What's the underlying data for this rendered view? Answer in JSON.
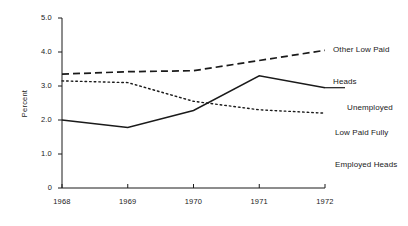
{
  "chart_data": {
    "type": "line",
    "title": "",
    "xlabel": "",
    "ylabel": "Percent",
    "categories": [
      "1968",
      "1969",
      "1970",
      "1971",
      "1972"
    ],
    "x": [
      1968,
      1969,
      1970,
      1971,
      1972
    ],
    "xlim": [
      1968,
      1972
    ],
    "ylim": [
      0,
      5.0
    ],
    "yticks": [
      "0",
      "1.0",
      "2.0",
      "3.0",
      "4.0",
      "5.0"
    ],
    "ytick_values": [
      0,
      1.0,
      2.0,
      3.0,
      4.0,
      5.0
    ],
    "xticks": [
      "1968",
      "1969",
      "1970",
      "1971",
      "1972"
    ],
    "grid": false,
    "legend_position": "inline-right-of-line-ends",
    "series": [
      {
        "name": "Other Low Paid Heads",
        "label_lines": [
          "Other Low Paid",
          "Heads"
        ],
        "style": "dashed",
        "color": "#1a1a1a",
        "values": [
          3.35,
          3.42,
          3.45,
          3.75,
          4.05
        ]
      },
      {
        "name": "Unemployed",
        "label_lines": [
          "Unemployed"
        ],
        "style": "solid",
        "color": "#1a1a1a",
        "values": [
          2.0,
          1.78,
          2.28,
          3.3,
          2.95
        ]
      },
      {
        "name": "Low Paid Fully Employed Heads",
        "label_lines": [
          "Low Paid Fully",
          "Employed Heads"
        ],
        "style": "dotted",
        "color": "#1a1a1a",
        "values": [
          3.15,
          3.1,
          2.55,
          2.3,
          2.2
        ]
      }
    ]
  },
  "axis": {
    "y_title": "Percent",
    "y_tick_labels": [
      "5.0",
      "4.0",
      "3.0",
      "2.0",
      "1.0",
      "0"
    ],
    "x_tick_labels": [
      "1968",
      "1969",
      "1970",
      "1971",
      "1972"
    ]
  },
  "labels": {
    "other_low_paid_line1": "Other Low Paid",
    "other_low_paid_line2": "Heads",
    "unemployed": "Unemployed",
    "low_paid_fully_line1": "Low Paid Fully",
    "low_paid_fully_line2": "Employed Heads"
  }
}
